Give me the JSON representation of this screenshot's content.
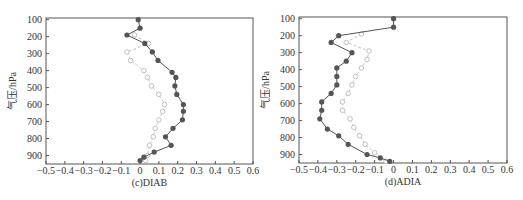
{
  "chart_data": [
    {
      "type": "line",
      "title": "(c)DIAB",
      "xlabel": "(c)DIAB",
      "ylabel": "气压/hPa",
      "xlim": [
        -0.5,
        0.6
      ],
      "ylim": [
        950,
        100
      ],
      "y_inverted": true,
      "xticks": [
        "-0.5",
        "-0.4",
        "-0.3",
        "-0.2",
        "-0.1",
        "0",
        "0.1",
        "0.2",
        "0.3",
        "0.4",
        "0.5",
        "0.6"
      ],
      "yticks": [
        "100",
        "200",
        "300",
        "400",
        "500",
        "600",
        "700",
        "800",
        "900"
      ],
      "grid": false,
      "legend": null,
      "series": [
        {
          "name": "dark (filled circles)",
          "color": "#555555",
          "marker": "filled-circle",
          "pressure": [
            100,
            150,
            190,
            240,
            290,
            340,
            410,
            440,
            490,
            540,
            600,
            640,
            690,
            740,
            790,
            840,
            880,
            910,
            930
          ],
          "values": [
            -0.01,
            0.0,
            -0.07,
            0.025,
            0.065,
            0.095,
            0.17,
            0.19,
            0.185,
            0.195,
            0.23,
            0.23,
            0.225,
            0.175,
            0.135,
            0.165,
            0.075,
            0.02,
            0.0
          ]
        },
        {
          "name": "light (open circles, dashed)",
          "color": "#bbbbbb",
          "marker": "open-circle",
          "pressure": [
            190,
            240,
            290,
            340,
            400,
            440,
            490,
            540,
            600,
            640,
            690,
            740,
            790,
            840,
            900,
            930
          ],
          "values": [
            -0.03,
            0.045,
            -0.07,
            -0.05,
            0.02,
            0.04,
            0.06,
            0.1,
            0.13,
            0.12,
            0.1,
            0.08,
            0.07,
            0.05,
            0.04,
            0.03
          ]
        }
      ]
    },
    {
      "type": "line",
      "title": "(d)ADIA",
      "xlabel": "(d)ADIA",
      "ylabel": "气压/hPa",
      "xlim": [
        -0.5,
        0.6
      ],
      "ylim": [
        950,
        100
      ],
      "y_inverted": true,
      "xticks": [
        "-0.5",
        "-0.4",
        "-0.3",
        "-0.2",
        "-0.1",
        "0",
        "0.1",
        "0.2",
        "0.3",
        "0.4",
        "0.5",
        "0.6"
      ],
      "yticks": [
        "100",
        "200",
        "300",
        "400",
        "500",
        "600",
        "700",
        "800",
        "900"
      ],
      "grid": false,
      "legend": null,
      "series": [
        {
          "name": "dark (filled circles)",
          "color": "#555555",
          "marker": "filled-circle",
          "pressure": [
            100,
            150,
            200,
            240,
            300,
            350,
            390,
            440,
            490,
            540,
            590,
            640,
            690,
            750,
            790,
            840,
            900,
            920,
            940
          ],
          "values": [
            0.0,
            0.0,
            -0.29,
            -0.33,
            -0.22,
            -0.25,
            -0.3,
            -0.3,
            -0.3,
            -0.33,
            -0.38,
            -0.38,
            -0.39,
            -0.35,
            -0.29,
            -0.24,
            -0.14,
            -0.07,
            -0.02
          ]
        },
        {
          "name": "light (open circles, dashed)",
          "color": "#bbbbbb",
          "marker": "open-circle",
          "pressure": [
            190,
            240,
            290,
            340,
            390,
            440,
            490,
            540,
            590,
            640,
            690,
            740,
            790,
            840,
            890,
            940
          ],
          "values": [
            -0.17,
            -0.25,
            -0.13,
            -0.14,
            -0.17,
            -0.2,
            -0.22,
            -0.24,
            -0.27,
            -0.27,
            -0.23,
            -0.21,
            -0.18,
            -0.15,
            -0.1,
            -0.04
          ]
        }
      ]
    }
  ],
  "panels": [
    {
      "caption": "(c)DIAB",
      "ylabel": "气压/hPa"
    },
    {
      "caption": "(d)ADIA",
      "ylabel": "气压/hPa"
    }
  ]
}
